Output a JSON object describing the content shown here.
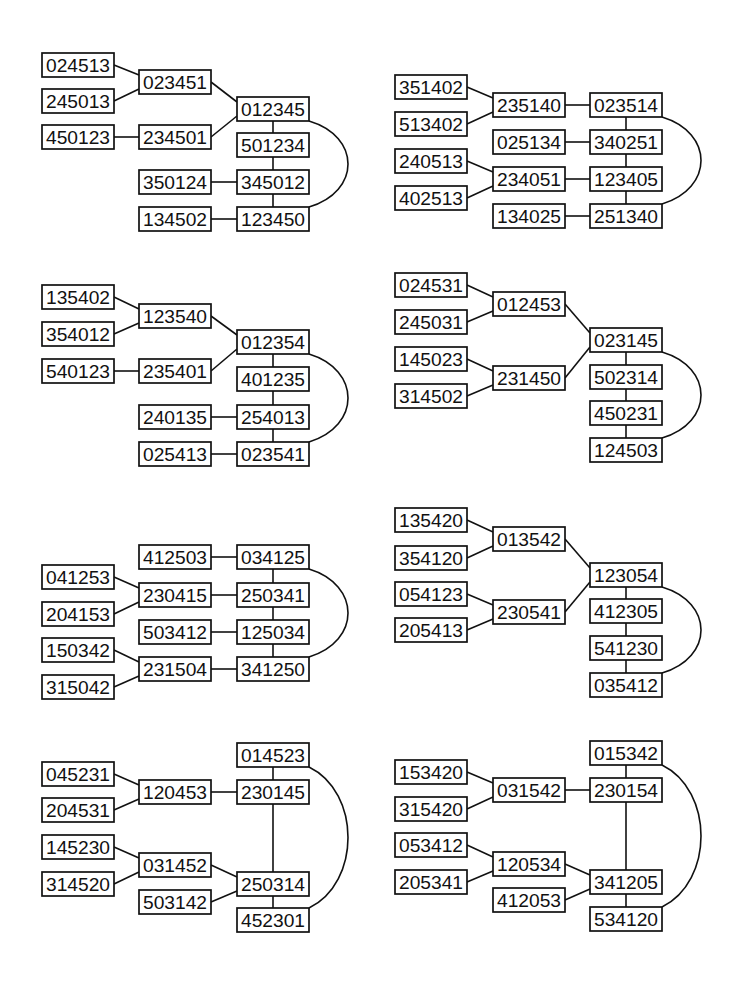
{
  "figure": {
    "width": 741,
    "height": 984,
    "background": "#ffffff",
    "ink_color": "#111111",
    "box_width": 72,
    "box_height": 24
  },
  "diagrams": [
    {
      "name": "diagram-1",
      "nodes": [
        {
          "label": "024513",
          "x": 42,
          "y": 53
        },
        {
          "label": "245013",
          "x": 42,
          "y": 89
        },
        {
          "label": "450123",
          "x": 42,
          "y": 125
        },
        {
          "label": "023451",
          "x": 139,
          "y": 70
        },
        {
          "label": "234501",
          "x": 139,
          "y": 125
        },
        {
          "label": "350124",
          "x": 139,
          "y": 170
        },
        {
          "label": "134502",
          "x": 139,
          "y": 207
        },
        {
          "label": "012345",
          "x": 237,
          "y": 97
        },
        {
          "label": "501234",
          "x": 237,
          "y": 133
        },
        {
          "label": "345012",
          "x": 237,
          "y": 170
        },
        {
          "label": "123450",
          "x": 237,
          "y": 207
        }
      ],
      "edges": [
        [
          "024513",
          "023451"
        ],
        [
          "245013",
          "023451"
        ],
        [
          "023451",
          "012345"
        ],
        [
          "450123",
          "234501"
        ],
        [
          "234501",
          "012345"
        ],
        [
          "012345",
          "501234"
        ],
        [
          "501234",
          "345012"
        ],
        [
          "350124",
          "345012"
        ],
        [
          "345012",
          "123450"
        ],
        [
          "134502",
          "123450"
        ]
      ],
      "arc": [
        "012345",
        "123450"
      ]
    },
    {
      "name": "diagram-2",
      "nodes": [
        {
          "label": "351402",
          "x": 395,
          "y": 75
        },
        {
          "label": "513402",
          "x": 395,
          "y": 112
        },
        {
          "label": "240513",
          "x": 395,
          "y": 149
        },
        {
          "label": "402513",
          "x": 395,
          "y": 186
        },
        {
          "label": "235140",
          "x": 493,
          "y": 93
        },
        {
          "label": "025134",
          "x": 493,
          "y": 130
        },
        {
          "label": "234051",
          "x": 493,
          "y": 167
        },
        {
          "label": "134025",
          "x": 493,
          "y": 204
        },
        {
          "label": "023514",
          "x": 590,
          "y": 93
        },
        {
          "label": "340251",
          "x": 590,
          "y": 130
        },
        {
          "label": "123405",
          "x": 590,
          "y": 167
        },
        {
          "label": "251340",
          "x": 590,
          "y": 204
        }
      ],
      "edges": [
        [
          "351402",
          "235140"
        ],
        [
          "513402",
          "235140"
        ],
        [
          "235140",
          "023514"
        ],
        [
          "025134",
          "340251"
        ],
        [
          "240513",
          "234051"
        ],
        [
          "402513",
          "234051"
        ],
        [
          "234051",
          "123405"
        ],
        [
          "134025",
          "251340"
        ],
        [
          "023514",
          "340251"
        ],
        [
          "340251",
          "123405"
        ],
        [
          "123405",
          "251340"
        ]
      ],
      "arc": [
        "023514",
        "251340"
      ]
    },
    {
      "name": "diagram-3",
      "nodes": [
        {
          "label": "135402",
          "x": 42,
          "y": 285
        },
        {
          "label": "354012",
          "x": 42,
          "y": 322
        },
        {
          "label": "540123",
          "x": 42,
          "y": 359
        },
        {
          "label": "123540",
          "x": 139,
          "y": 304
        },
        {
          "label": "235401",
          "x": 139,
          "y": 359
        },
        {
          "label": "240135",
          "x": 139,
          "y": 405
        },
        {
          "label": "025413",
          "x": 139,
          "y": 442
        },
        {
          "label": "012354",
          "x": 237,
          "y": 330
        },
        {
          "label": "401235",
          "x": 237,
          "y": 367
        },
        {
          "label": "254013",
          "x": 237,
          "y": 405
        },
        {
          "label": "023541",
          "x": 237,
          "y": 442
        }
      ],
      "edges": [
        [
          "135402",
          "123540"
        ],
        [
          "354012",
          "123540"
        ],
        [
          "123540",
          "012354"
        ],
        [
          "540123",
          "235401"
        ],
        [
          "235401",
          "012354"
        ],
        [
          "012354",
          "401235"
        ],
        [
          "401235",
          "254013"
        ],
        [
          "240135",
          "254013"
        ],
        [
          "254013",
          "023541"
        ],
        [
          "025413",
          "023541"
        ]
      ],
      "arc": [
        "012354",
        "023541"
      ]
    },
    {
      "name": "diagram-4",
      "nodes": [
        {
          "label": "024531",
          "x": 395,
          "y": 273
        },
        {
          "label": "245031",
          "x": 395,
          "y": 310
        },
        {
          "label": "145023",
          "x": 395,
          "y": 347
        },
        {
          "label": "314502",
          "x": 395,
          "y": 384
        },
        {
          "label": "012453",
          "x": 493,
          "y": 292
        },
        {
          "label": "231450",
          "x": 493,
          "y": 366
        },
        {
          "label": "023145",
          "x": 590,
          "y": 328
        },
        {
          "label": "502314",
          "x": 590,
          "y": 365
        },
        {
          "label": "450231",
          "x": 590,
          "y": 401
        },
        {
          "label": "124503",
          "x": 590,
          "y": 438
        }
      ],
      "edges": [
        [
          "024531",
          "012453"
        ],
        [
          "245031",
          "012453"
        ],
        [
          "012453",
          "023145"
        ],
        [
          "145023",
          "231450"
        ],
        [
          "314502",
          "231450"
        ],
        [
          "231450",
          "023145"
        ],
        [
          "023145",
          "502314"
        ],
        [
          "502314",
          "450231"
        ],
        [
          "450231",
          "124503"
        ]
      ],
      "arc": [
        "023145",
        "124503"
      ]
    },
    {
      "name": "diagram-5",
      "nodes": [
        {
          "label": "412503",
          "x": 139,
          "y": 545
        },
        {
          "label": "034125",
          "x": 237,
          "y": 545
        },
        {
          "label": "041253",
          "x": 42,
          "y": 565
        },
        {
          "label": "230415",
          "x": 139,
          "y": 583
        },
        {
          "label": "250341",
          "x": 237,
          "y": 583
        },
        {
          "label": "204153",
          "x": 42,
          "y": 602
        },
        {
          "label": "503412",
          "x": 139,
          "y": 620
        },
        {
          "label": "125034",
          "x": 237,
          "y": 620
        },
        {
          "label": "150342",
          "x": 42,
          "y": 638
        },
        {
          "label": "231504",
          "x": 139,
          "y": 657
        },
        {
          "label": "341250",
          "x": 237,
          "y": 657
        },
        {
          "label": "315042",
          "x": 42,
          "y": 675
        }
      ],
      "edges": [
        [
          "412503",
          "034125"
        ],
        [
          "041253",
          "230415"
        ],
        [
          "204153",
          "230415"
        ],
        [
          "230415",
          "250341"
        ],
        [
          "503412",
          "125034"
        ],
        [
          "150342",
          "231504"
        ],
        [
          "315042",
          "231504"
        ],
        [
          "231504",
          "341250"
        ],
        [
          "034125",
          "250341"
        ],
        [
          "250341",
          "125034"
        ],
        [
          "125034",
          "341250"
        ]
      ],
      "arc": [
        "034125",
        "341250"
      ]
    },
    {
      "name": "diagram-6",
      "nodes": [
        {
          "label": "135420",
          "x": 395,
          "y": 508
        },
        {
          "label": "354120",
          "x": 395,
          "y": 546
        },
        {
          "label": "013542",
          "x": 493,
          "y": 527
        },
        {
          "label": "054123",
          "x": 395,
          "y": 582
        },
        {
          "label": "205413",
          "x": 395,
          "y": 618
        },
        {
          "label": "230541",
          "x": 493,
          "y": 600
        },
        {
          "label": "123054",
          "x": 590,
          "y": 563
        },
        {
          "label": "412305",
          "x": 590,
          "y": 599
        },
        {
          "label": "541230",
          "x": 590,
          "y": 636
        },
        {
          "label": "035412",
          "x": 590,
          "y": 673
        }
      ],
      "edges": [
        [
          "135420",
          "013542"
        ],
        [
          "354120",
          "013542"
        ],
        [
          "013542",
          "123054"
        ],
        [
          "054123",
          "230541"
        ],
        [
          "205413",
          "230541"
        ],
        [
          "230541",
          "123054"
        ],
        [
          "123054",
          "412305"
        ],
        [
          "412305",
          "541230"
        ],
        [
          "541230",
          "035412"
        ]
      ],
      "arc": [
        "123054",
        "035412"
      ]
    },
    {
      "name": "diagram-7",
      "nodes": [
        {
          "label": "014523",
          "x": 237,
          "y": 743
        },
        {
          "label": "045231",
          "x": 42,
          "y": 762
        },
        {
          "label": "120453",
          "x": 139,
          "y": 780
        },
        {
          "label": "230145",
          "x": 237,
          "y": 780
        },
        {
          "label": "204531",
          "x": 42,
          "y": 798
        },
        {
          "label": "145230",
          "x": 42,
          "y": 835
        },
        {
          "label": "031452",
          "x": 139,
          "y": 853
        },
        {
          "label": "314520",
          "x": 42,
          "y": 872
        },
        {
          "label": "250314",
          "x": 237,
          "y": 872
        },
        {
          "label": "503142",
          "x": 139,
          "y": 890
        },
        {
          "label": "452301",
          "x": 237,
          "y": 908
        }
      ],
      "edges": [
        [
          "045231",
          "120453"
        ],
        [
          "204531",
          "120453"
        ],
        [
          "120453",
          "230145"
        ],
        [
          "014523",
          "230145"
        ],
        [
          "230145",
          "250314"
        ],
        [
          "145230",
          "031452"
        ],
        [
          "314520",
          "031452"
        ],
        [
          "031452",
          "250314"
        ],
        [
          "503142",
          "250314"
        ],
        [
          "250314",
          "452301"
        ]
      ],
      "arc": [
        "014523",
        "452301"
      ]
    },
    {
      "name": "diagram-8",
      "nodes": [
        {
          "label": "015342",
          "x": 590,
          "y": 741
        },
        {
          "label": "153420",
          "x": 395,
          "y": 760
        },
        {
          "label": "031542",
          "x": 493,
          "y": 778
        },
        {
          "label": "230154",
          "x": 590,
          "y": 778
        },
        {
          "label": "315420",
          "x": 395,
          "y": 797
        },
        {
          "label": "053412",
          "x": 395,
          "y": 833
        },
        {
          "label": "120534",
          "x": 493,
          "y": 852
        },
        {
          "label": "205341",
          "x": 395,
          "y": 870
        },
        {
          "label": "341205",
          "x": 590,
          "y": 870
        },
        {
          "label": "412053",
          "x": 493,
          "y": 888
        },
        {
          "label": "534120",
          "x": 590,
          "y": 907
        }
      ],
      "edges": [
        [
          "153420",
          "031542"
        ],
        [
          "315420",
          "031542"
        ],
        [
          "031542",
          "230154"
        ],
        [
          "015342",
          "230154"
        ],
        [
          "230154",
          "341205"
        ],
        [
          "053412",
          "120534"
        ],
        [
          "205341",
          "120534"
        ],
        [
          "120534",
          "341205"
        ],
        [
          "412053",
          "341205"
        ],
        [
          "341205",
          "534120"
        ]
      ],
      "arc": [
        "015342",
        "534120"
      ]
    }
  ]
}
